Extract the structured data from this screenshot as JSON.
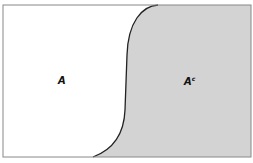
{
  "diagram": {
    "type": "venn-complement",
    "set_label": "A",
    "complement_label": "A",
    "complement_superscript": "c",
    "colors": {
      "background": "#ffffff",
      "complement_fill": "#d3d3d3",
      "border": "#888888",
      "curve": "#222222"
    }
  }
}
